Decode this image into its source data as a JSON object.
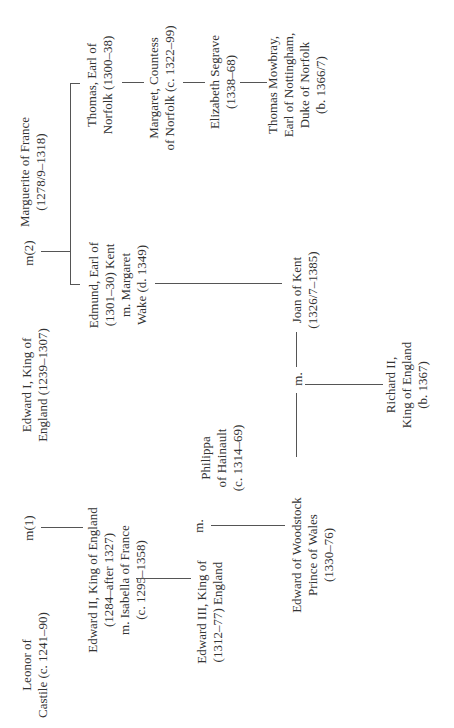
{
  "diagram": {
    "type": "family-tree",
    "orientation": "rotated-90-ccw",
    "line_color": "#555555",
    "text_color": "#333333"
  },
  "people": {
    "marguerite": {
      "line1": "Marguerite of France",
      "line2": "(1278/9–1318)"
    },
    "edward_i": {
      "line1": "Edward I, King of",
      "line2": "England (1239–1307)"
    },
    "leonor": {
      "line1": "Leonor of",
      "line2": "Castile (c. 1241–90)"
    },
    "thomas_norfolk": {
      "line1": "Thomas, Earl of",
      "line2": "Norfolk (1300–38)"
    },
    "edmund_kent": {
      "line1": "Edmund, Earl of",
      "line2": "(1301–30) Kent",
      "line3": "m. Margaret",
      "line4": "Wake (d. 1349)"
    },
    "edward_ii": {
      "line1": "Edward II, King of England",
      "line2": "(1284–after 1327)",
      "line3": "m. Isabella of France",
      "line4": "(c. 1295–1358)"
    },
    "margaret_norfolk": {
      "line1": "Margaret, Countess",
      "line2": "of Norfolk (c. 1322–99)"
    },
    "elizabeth_segrave": {
      "line1": "Elizabeth Segrave",
      "line2": "(1338–68)"
    },
    "thomas_mowbray": {
      "line1": "Thomas Mowbray,",
      "line2": "Earl of Nottingham,",
      "line3": "Duke of Norfolk",
      "line4": "(b. 1366/7)"
    },
    "joan_kent": {
      "line1": "Joan of Kent",
      "line2": "(1326/7–1385)"
    },
    "edward_iii": {
      "line1": "Edward III, King of",
      "line2": "(1312–77) England"
    },
    "philippa": {
      "line1": "Philippa",
      "line2": "of Hainault",
      "line3": "(c. 1314–69)"
    },
    "edward_woodstock": {
      "line1": "Edward of Woodstock",
      "line2": "Prince of Wales",
      "line3": "(1330–76)"
    },
    "richard_ii": {
      "line1": "Richard II,",
      "line2": "King of England",
      "line3": "(b. 1367)"
    }
  },
  "marriages": {
    "m2": "m(2)",
    "m1": "m(1)",
    "m_edward_iii_philippa": "m.",
    "m_woodstock_joan": "m."
  }
}
